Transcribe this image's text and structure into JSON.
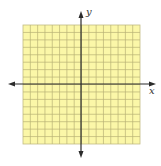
{
  "diagram": {
    "type": "coordinate-plane",
    "grid": {
      "columns": 16,
      "rows": 16,
      "fill": "#fbf7a8",
      "line_color": "#b8b276",
      "border_color": "#c2bc84"
    },
    "axes": {
      "color": "#2b2b2b",
      "x_label": "x",
      "y_label": "y",
      "origin_column": 8,
      "origin_row": 8
    },
    "background": "#ffffff"
  }
}
